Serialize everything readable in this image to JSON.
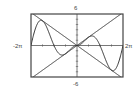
{
  "chart_data": {
    "type": "line",
    "title": "",
    "xlabel": "",
    "ylabel": "",
    "xlim": [
      -6.2832,
      6.2832
    ],
    "ylim": [
      -6,
      6
    ],
    "grid": false,
    "x_tick_spacing": 1.5708,
    "y_tick_spacing": 1,
    "tick_labels": {
      "x_min": "-2π",
      "x_max": "2π",
      "y_max": "6",
      "y_min": "-6"
    },
    "series": [
      {
        "name": "y = x",
        "expression": "x",
        "color": "#333333"
      },
      {
        "name": "y = -x",
        "expression": "-x",
        "color": "#333333"
      },
      {
        "name": "y = |x| sin x",
        "expression": "abs(x)*sin(x)",
        "color": "#333333"
      }
    ]
  },
  "frame": {
    "left": 31,
    "top": 14,
    "right": 123,
    "bottom": 77,
    "color": "#444444"
  }
}
